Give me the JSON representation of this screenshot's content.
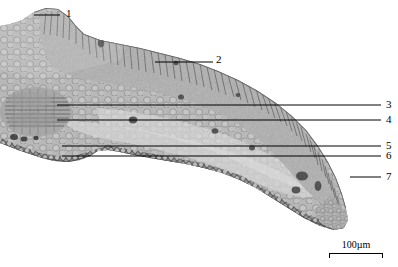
{
  "figure": {
    "kind": "light-micrograph",
    "background_color": "#ffffff",
    "tissue_tone_light": "#cfcfcf",
    "tissue_tone_mid": "#9a9a9a",
    "tissue_tone_dark": "#4a4a4a",
    "leader_color": "#000000"
  },
  "labels": [
    {
      "id": "1",
      "text": "1",
      "x": 66,
      "y": 11,
      "leader": {
        "x1": 34,
        "y1": 15,
        "x2": 60,
        "y2": 15
      }
    },
    {
      "id": "2",
      "text": "2",
      "x": 218,
      "y": 56,
      "leader": {
        "x1": 155,
        "y1": 62,
        "x2": 213,
        "y2": 62
      }
    },
    {
      "id": "3",
      "text": "3",
      "x": 386,
      "y": 100,
      "leader": {
        "x1": 57,
        "y1": 105,
        "x2": 381,
        "y2": 105
      }
    },
    {
      "id": "4",
      "text": "4",
      "x": 386,
      "y": 115,
      "leader": {
        "x1": 57,
        "y1": 120,
        "x2": 381,
        "y2": 120
      }
    },
    {
      "id": "5",
      "text": "5",
      "x": 386,
      "y": 141,
      "leader": {
        "x1": 62,
        "y1": 146,
        "x2": 381,
        "y2": 146
      }
    },
    {
      "id": "6",
      "text": "6",
      "x": 386,
      "y": 151,
      "leader": {
        "x1": 62,
        "y1": 156,
        "x2": 381,
        "y2": 156
      }
    },
    {
      "id": "7",
      "text": "7",
      "x": 386,
      "y": 172,
      "leader": {
        "x1": 350,
        "y1": 177,
        "x2": 381,
        "y2": 177
      }
    }
  ],
  "scale_bar": {
    "value": "100",
    "unit": "µm",
    "text": "100µm",
    "length_px": 54
  }
}
